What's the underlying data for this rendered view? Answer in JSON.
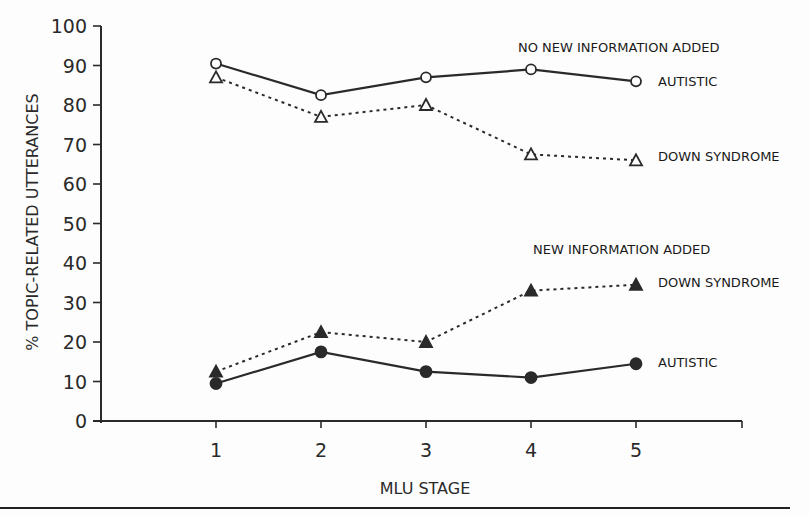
{
  "chart_data": {
    "type": "line",
    "title": "",
    "xlabel": "MLU STAGE",
    "ylabel": "% TOPIC-RELATED UTTERANCES",
    "x": [
      1,
      2,
      3,
      4,
      5
    ],
    "xlim": [
      0,
      6.1
    ],
    "ylim": [
      0,
      100
    ],
    "yticks": [
      0,
      10,
      20,
      30,
      40,
      50,
      60,
      70,
      80,
      90,
      100
    ],
    "xticks": [
      1,
      2,
      3,
      4,
      5
    ],
    "grid": false,
    "groups": [
      {
        "label": "NO NEW INFORMATION ADDED"
      },
      {
        "label": "NEW INFORMATION ADDED"
      }
    ],
    "series": [
      {
        "name": "Autistic - No new information added",
        "label": "AUTISTIC",
        "group": "NO NEW INFORMATION ADDED",
        "marker": "open-circle",
        "line": "solid",
        "values": [
          90.5,
          82.5,
          87,
          89,
          86
        ]
      },
      {
        "name": "Down Syndrome - No new information added",
        "label": "DOWN SYNDROME",
        "group": "NO NEW INFORMATION ADDED",
        "marker": "open-triangle",
        "line": "dotted",
        "values": [
          87,
          77,
          80,
          67.5,
          66
        ]
      },
      {
        "name": "Down Syndrome - New information added",
        "label": "DOWN SYNDROME",
        "group": "NEW INFORMATION ADDED",
        "marker": "filled-triangle",
        "line": "dotted",
        "values": [
          12.5,
          22.5,
          20,
          33,
          34.5
        ]
      },
      {
        "name": "Autistic - New information added",
        "label": "AUTISTIC",
        "group": "NEW INFORMATION ADDED",
        "marker": "filled-circle",
        "line": "solid",
        "values": [
          9.5,
          17.5,
          12.5,
          11,
          14.5
        ]
      }
    ]
  },
  "colors": {
    "ink": "#2a2a2a",
    "background": "#fdfdfd"
  }
}
